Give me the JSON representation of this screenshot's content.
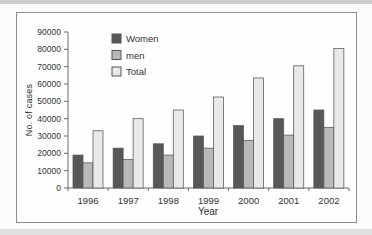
{
  "figure": {
    "ylabel": "No. of cases",
    "xlabel": "Year"
  },
  "chart_data": {
    "type": "bar",
    "title": "",
    "categories": [
      "1996",
      "1997",
      "1998",
      "1999",
      "2000",
      "2001",
      "2002"
    ],
    "series": [
      {
        "name": "Women",
        "color": "#58585a",
        "values": [
          19000,
          23000,
          25500,
          30000,
          36000,
          40000,
          45000
        ]
      },
      {
        "name": "men",
        "color": "#b9b9b7",
        "values": [
          14500,
          16500,
          19000,
          23000,
          27500,
          30500,
          35000
        ]
      },
      {
        "name": "Total",
        "color": "#e9e9e7",
        "values": [
          33000,
          40000,
          45000,
          52500,
          63500,
          70500,
          80500
        ]
      }
    ],
    "xlabel": "Year",
    "ylabel": "No. of cases",
    "ylim": [
      0,
      90000
    ],
    "ytick_step": 10000,
    "grid": false,
    "legend_position": "top-left",
    "axis_color": "#6a6a6a",
    "text_color": "#333333",
    "bar_stroke": "#555555"
  }
}
